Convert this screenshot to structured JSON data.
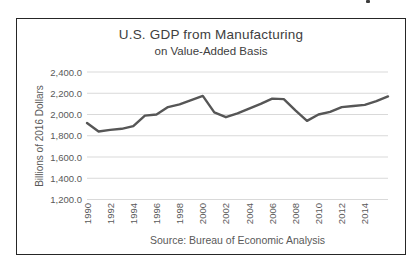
{
  "chart_data": {
    "type": "line",
    "title": "U.S. GDP from Manufacturing",
    "subtitle": "on Value-Added Basis",
    "xlabel": "",
    "ylabel": "Billions of 2016 Dollars",
    "source_note": "Source: Bureau of Economic Analysis",
    "x": [
      1990,
      1991,
      1992,
      1993,
      1994,
      1995,
      1996,
      1997,
      1998,
      1999,
      2000,
      2001,
      2002,
      2003,
      2004,
      2005,
      2006,
      2007,
      2008,
      2009,
      2010,
      2011,
      2012,
      2013,
      2014,
      2015,
      2016
    ],
    "series": [
      {
        "name": "U.S. GDP from Manufacturing (value-added, billions of 2016 dollars)",
        "values": [
          1920,
          1840,
          1855,
          1865,
          1890,
          1990,
          2000,
          2070,
          2095,
          2135,
          2175,
          2020,
          1975,
          2010,
          2055,
          2100,
          2150,
          2145,
          2040,
          1940,
          2000,
          2025,
          2070,
          2080,
          2090,
          2125,
          2170
        ]
      }
    ],
    "ylim": [
      1200,
      2400
    ],
    "ytick_step": 200,
    "ytick_labels": [
      "2,400.0",
      "2,200.0",
      "2,000.0",
      "1,800.0",
      "1,600.0",
      "1,400.0",
      "1,200.0"
    ],
    "xtick_labels": [
      "1990",
      "1992",
      "1994",
      "1996",
      "1998",
      "2000",
      "2002",
      "2004",
      "2006",
      "2008",
      "2010",
      "2012",
      "2014"
    ],
    "grid": "horizontal",
    "legend": "none",
    "colors": {
      "line": "#565656",
      "grid": "#d9d9d9",
      "tick_text": "#595959",
      "title_text": "#404040",
      "frame_border": "#262626"
    }
  }
}
